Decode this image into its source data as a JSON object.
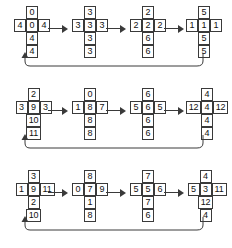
{
  "diagram": {
    "background_color": "#ffffff",
    "line_color": "#3a3a3a",
    "text_color": "#111111",
    "rows": [
      {
        "id": "row-1",
        "steps": [
          {
            "top": "0",
            "left": "4",
            "center": "0",
            "right": "4",
            "below1": "4",
            "below2": "4"
          },
          {
            "top": "3",
            "left": "3",
            "center": "3",
            "right": "3",
            "below1": "3",
            "below2": "3"
          },
          {
            "top": "2",
            "left": "2",
            "center": "2",
            "right": "2",
            "below1": "6",
            "below2": "6"
          },
          {
            "top": "5",
            "left": "1",
            "center": "1",
            "right": "1",
            "below1": "5",
            "below2": "5"
          }
        ]
      },
      {
        "id": "row-2",
        "steps": [
          {
            "top": "2",
            "left": "3",
            "center": "9",
            "right": "3",
            "below1": "10",
            "below2": "11"
          },
          {
            "top": "0",
            "left": "1",
            "center": "8",
            "right": "7",
            "below1": "8",
            "below2": "8"
          },
          {
            "top": "6",
            "left": "5",
            "center": "6",
            "right": "5",
            "below1": "6",
            "below2": "6"
          },
          {
            "top": "4",
            "left": "12",
            "center": "4",
            "right": "12",
            "below1": "4",
            "below2": "4"
          }
        ]
      },
      {
        "id": "row-3",
        "steps": [
          {
            "top": "3",
            "left": "1",
            "center": "9",
            "right": "11",
            "below1": "2",
            "below2": "10"
          },
          {
            "top": "8",
            "left": "0",
            "center": "7",
            "right": "9",
            "below1": "1",
            "below2": "8"
          },
          {
            "top": "7",
            "left": "5",
            "center": "5",
            "right": "6",
            "below1": "7",
            "below2": "6"
          },
          {
            "top": "4",
            "left": "5",
            "center": "3",
            "right": "11",
            "below1": "12",
            "below2": "4"
          }
        ]
      }
    ],
    "arrow_label": "",
    "feedback_loop_label": ""
  }
}
